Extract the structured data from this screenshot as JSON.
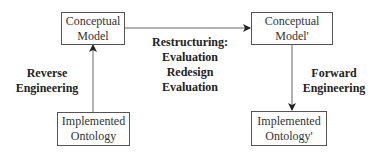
{
  "diagram": {
    "nodes": [
      {
        "id": "conceptual_model",
        "lines": [
          "Conceptual",
          "Model"
        ]
      },
      {
        "id": "conceptual_model_prime",
        "lines": [
          "Conceptual",
          "Model'"
        ]
      },
      {
        "id": "implemented_ontology",
        "lines": [
          "Implemented",
          "Ontology"
        ]
      },
      {
        "id": "implemented_ontology_prime",
        "lines": [
          "Implemented",
          "Ontology'"
        ]
      }
    ],
    "labels": {
      "reverse": [
        "Reverse",
        "Engineering"
      ],
      "restructuring": [
        "Restructuring:",
        "Evaluation",
        "Redesign",
        "Evaluation"
      ],
      "forward": [
        "Forward",
        "Engineering"
      ]
    },
    "edges": [
      {
        "from": "implemented_ontology",
        "to": "conceptual_model",
        "label": "Reverse Engineering"
      },
      {
        "from": "conceptual_model",
        "to": "conceptual_model_prime",
        "label": "Restructuring: Evaluation Redesign Evaluation"
      },
      {
        "from": "conceptual_model_prime",
        "to": "implemented_ontology_prime",
        "label": "Forward Engineering"
      }
    ],
    "colors": {
      "line": "#555555",
      "text": "#222222",
      "background": "#ffffff"
    }
  }
}
